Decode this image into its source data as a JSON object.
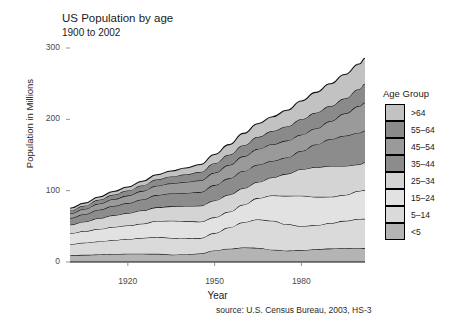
{
  "chart_data": {
    "type": "area",
    "title": "US Population by age",
    "subtitle": "1900 to 2002",
    "xlabel": "Year",
    "ylabel": "Population in Millions",
    "source": "source: U.S. Census Bureau, 2003, HS-3",
    "legend_title": "Age Group",
    "legend_position": "right",
    "grid": false,
    "stacked": true,
    "xlim": [
      1900,
      2002
    ],
    "ylim": [
      0,
      300
    ],
    "xticks": [
      1920,
      1950,
      1980
    ],
    "yticks": [
      0,
      100,
      200,
      300
    ],
    "x": [
      1900,
      1905,
      1910,
      1915,
      1920,
      1925,
      1930,
      1935,
      1940,
      1945,
      1950,
      1955,
      1960,
      1965,
      1970,
      1975,
      1980,
      1985,
      1990,
      1995,
      2000,
      2002
    ],
    "series": [
      {
        "name": "<5",
        "color": "#b4b4b4",
        "values": [
          9.2,
          10.0,
          10.6,
          11.2,
          11.6,
          11.5,
          11.4,
          10.3,
          10.6,
          12.0,
          16.2,
          18.6,
          20.3,
          19.8,
          17.2,
          15.9,
          16.3,
          18.0,
          18.8,
          19.6,
          19.2,
          19.5
        ]
      },
      {
        "name": "5-14",
        "color": "#dadada",
        "values": [
          16.0,
          17.1,
          18.2,
          19.4,
          20.7,
          22.3,
          23.6,
          23.5,
          22.4,
          21.5,
          24.3,
          29.7,
          35.5,
          39.8,
          40.7,
          37.0,
          34.1,
          33.5,
          35.6,
          38.1,
          41.1,
          41.0
        ]
      },
      {
        "name": "15-24",
        "color": "#e2e2e2",
        "values": [
          14.9,
          16.0,
          17.4,
          18.5,
          18.8,
          19.9,
          22.4,
          24.0,
          24.0,
          23.0,
          22.1,
          22.1,
          24.6,
          30.0,
          35.4,
          39.8,
          42.5,
          39.8,
          37.0,
          36.3,
          39.2,
          40.3
        ]
      },
      {
        "name": "25-34",
        "color": "#d4d4d4",
        "values": [
          12.2,
          13.4,
          15.1,
          16.3,
          17.3,
          18.5,
          19.2,
          20.2,
          21.4,
          22.5,
          23.7,
          24.0,
          22.9,
          22.5,
          25.3,
          30.9,
          37.1,
          41.6,
          43.2,
          40.6,
          37.2,
          38.8
        ]
      },
      {
        "name": "35-44",
        "color": "#8c8c8c",
        "values": [
          9.3,
          10.4,
          11.9,
          13.0,
          14.2,
          15.4,
          17.2,
          18.0,
          18.3,
          19.0,
          21.5,
          22.9,
          24.2,
          24.4,
          23.1,
          22.8,
          25.6,
          31.8,
          37.6,
          42.4,
          44.5,
          44.4
        ]
      },
      {
        "name": "45-54",
        "color": "#9a9a9a",
        "values": [
          6.4,
          7.3,
          8.5,
          9.6,
          10.5,
          11.8,
          13.1,
          14.2,
          15.5,
          16.4,
          17.3,
          18.6,
          20.6,
          22.0,
          23.3,
          23.8,
          22.8,
          22.4,
          25.2,
          31.1,
          37.4,
          39.6
        ]
      },
      {
        "name": "55-64",
        "color": "#8a8a8a",
        "values": [
          4.2,
          4.8,
          5.6,
          6.4,
          7.2,
          8.0,
          8.9,
          9.7,
          10.6,
          11.7,
          13.4,
          14.5,
          15.6,
          16.9,
          18.6,
          19.8,
          21.7,
          22.2,
          21.2,
          21.1,
          23.9,
          26.4
        ]
      },
      {
        "name": ">64",
        "color": "#c2c2c2",
        "values": [
          3.1,
          3.5,
          3.9,
          4.5,
          4.9,
          5.8,
          6.6,
          7.6,
          9.0,
          10.5,
          12.3,
          14.1,
          16.6,
          18.4,
          20.1,
          22.7,
          25.7,
          28.5,
          31.2,
          33.6,
          35.0,
          35.6
        ]
      }
    ],
    "totals": [
      75.3,
      82.5,
      91.2,
      98.9,
      105.2,
      113.2,
      122.4,
      127.5,
      131.8,
      136.6,
      150.8,
      164.5,
      180.3,
      193.8,
      203.7,
      212.7,
      225.8,
      237.8,
      249.8,
      262.8,
      277.5,
      285.6
    ]
  }
}
